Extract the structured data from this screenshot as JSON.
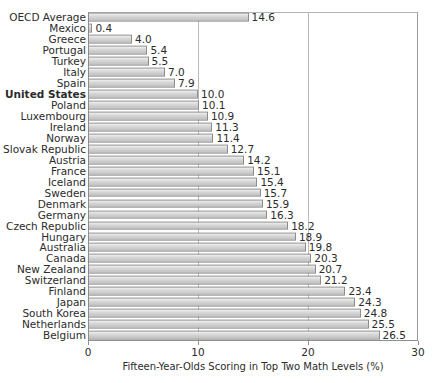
{
  "chart_data": {
    "type": "bar",
    "orientation": "horizontal",
    "title": "",
    "xlabel": "Fifteen-Year-Olds Scoring in Top Two Math Levels (%)",
    "ylabel": "",
    "xlim": [
      0,
      30
    ],
    "xticks": [
      "0",
      "10",
      "20",
      "30"
    ],
    "xtick_values": [
      0,
      10,
      20,
      30
    ],
    "grid": true,
    "grid_axis": "x",
    "legend": null,
    "bar_fill_color": "#d3d3d3",
    "bar_border_color": "#8c8c8c",
    "categories": [
      "OECD Average",
      "Mexico",
      "Greece",
      "Portugal",
      "Turkey",
      "Italy",
      "Spain",
      "United States",
      "Poland",
      "Luxembourg",
      "Ireland",
      "Norway",
      "Slovak Republic",
      "Austria",
      "France",
      "Iceland",
      "Sweden",
      "Denmark",
      "Germany",
      "Czech Republic",
      "Hungary",
      "Australia",
      "Canada",
      "New Zealand",
      "Switzerland",
      "Finland",
      "Japan",
      "South Korea",
      "Netherlands",
      "Belgium"
    ],
    "values": [
      14.6,
      0.4,
      4.0,
      5.4,
      5.5,
      7.0,
      7.9,
      10.0,
      10.1,
      10.9,
      11.3,
      11.4,
      12.7,
      14.2,
      15.1,
      15.4,
      15.7,
      15.9,
      16.3,
      18.2,
      18.9,
      19.8,
      20.3,
      20.7,
      21.2,
      23.4,
      24.3,
      24.8,
      25.5,
      26.5
    ],
    "value_labels": [
      "14.6",
      "0.4",
      "4.0",
      "5.4",
      "5.5",
      "7.0",
      "7.9",
      "10.0",
      "10.1",
      "10.9",
      "11.3",
      "11.4",
      "12.7",
      "14.2",
      "15.1",
      "15.4",
      "15.7",
      "15.9",
      "16.3",
      "18.2",
      "18.9",
      "19.8",
      "20.3",
      "20.7",
      "21.2",
      "23.4",
      "24.3",
      "24.8",
      "25.5",
      "26.5"
    ],
    "highlighted_category": "United States"
  }
}
